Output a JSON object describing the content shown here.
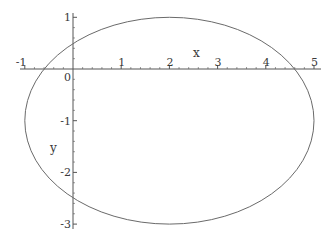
{
  "chart_data": {
    "type": "line",
    "title": "",
    "xlabel": "x",
    "ylabel": "y",
    "xlim": [
      -1.1,
      5.1
    ],
    "ylim": [
      -3.1,
      1.1
    ],
    "grid": false,
    "legend": null,
    "x_ticks": [
      "-1",
      "0",
      "1",
      "2",
      "3",
      "4",
      "5"
    ],
    "y_ticks": [
      "1",
      "-1",
      "-2",
      "-3"
    ],
    "curve": {
      "description": "ellipse (x-2)^2/9 + (y+1)^2/4 = 1",
      "center": [
        2,
        -1
      ],
      "semi_axis_x": 3,
      "semi_axis_y": 2,
      "x_intercepts": [
        -0.6,
        4.6
      ],
      "y_intercepts": [
        0.49,
        -2.49
      ]
    },
    "colors": {
      "axis": "#555555",
      "curve": "#6a6a6a",
      "text": "#3a3a3a"
    }
  },
  "labels": {
    "x_axis": "x",
    "y_axis": "y",
    "xticks": [
      {
        "v": -1,
        "t": "-1"
      },
      {
        "v": 0,
        "t": "0"
      },
      {
        "v": 1,
        "t": "1"
      },
      {
        "v": 2,
        "t": "2"
      },
      {
        "v": 3,
        "t": "3"
      },
      {
        "v": 4,
        "t": "4"
      },
      {
        "v": 5,
        "t": "5"
      }
    ],
    "yticks": [
      {
        "v": 1,
        "t": "1"
      },
      {
        "v": -1,
        "t": "-1"
      },
      {
        "v": -2,
        "t": "-2"
      },
      {
        "v": -3,
        "t": "-3"
      }
    ]
  }
}
